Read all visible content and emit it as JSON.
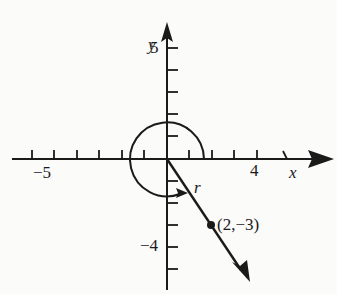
{
  "diagram": {
    "axes": {
      "x_label": "x",
      "y_label": "y",
      "x_tick_labels": [
        {
          "value": -5,
          "text": "−5"
        },
        {
          "value": 4,
          "text": "4"
        }
      ],
      "y_tick_labels": [
        {
          "value": 5,
          "text": "5"
        },
        {
          "value": -4,
          "text": "−4"
        }
      ],
      "x_range": [
        -6,
        6
      ],
      "y_range": [
        -6,
        6
      ]
    },
    "point": {
      "x": 2,
      "y": -3,
      "label": "(2,−3)"
    },
    "ray_label": "r",
    "angle_arc": "counterclockwise full-turn arc from positive x-axis to terminal ray",
    "colors": {
      "ink": "#1a1a1a",
      "background": "#fbfbfa"
    }
  }
}
